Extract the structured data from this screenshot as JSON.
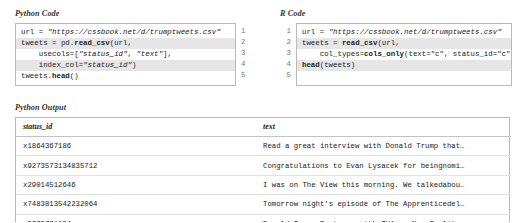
{
  "sections": {
    "python_code_label": "Python Code",
    "r_code_label": "R Code",
    "python_output_label": "Python Output"
  },
  "python_code": {
    "line_numbers": [
      "1",
      "2",
      "3",
      "4",
      "5"
    ],
    "lines": [
      [
        {
          "t": "url = ",
          "s": "plain"
        },
        {
          "t": "\"https://cssbook.net/d/trumptweets.csv\"",
          "s": "str"
        }
      ],
      [
        {
          "t": "tweets = pd.",
          "s": "plain"
        },
        {
          "t": "read_csv",
          "s": "kw"
        },
        {
          "t": "(url,",
          "s": "plain"
        }
      ],
      [
        {
          "t": "    usecols=[",
          "s": "plain"
        },
        {
          "t": "\"status_id\"",
          "s": "str"
        },
        {
          "t": ", ",
          "s": "plain"
        },
        {
          "t": "\"text\"",
          "s": "str"
        },
        {
          "t": "],",
          "s": "plain"
        }
      ],
      [
        {
          "t": "    index_col=",
          "s": "plain"
        },
        {
          "t": "\"status_id\"",
          "s": "str"
        },
        {
          "t": ")",
          "s": "plain"
        }
      ],
      [
        {
          "t": "tweets.",
          "s": "plain"
        },
        {
          "t": "head",
          "s": "kw"
        },
        {
          "t": "()",
          "s": "plain"
        }
      ]
    ]
  },
  "r_code": {
    "line_numbers": [
      "1",
      "2",
      "3",
      "4",
      "5"
    ],
    "lines": [
      [
        {
          "t": "url = ",
          "s": "plain"
        },
        {
          "t": "\"https://cssbook.net/d/trumptweets.csv\"",
          "s": "str"
        }
      ],
      [
        {
          "t": "tweets = ",
          "s": "plain"
        },
        {
          "t": "read_csv",
          "s": "kw"
        },
        {
          "t": "(url,",
          "s": "plain"
        }
      ],
      [
        {
          "t": "    col_types=",
          "s": "plain"
        },
        {
          "t": "cols_only",
          "s": "kw"
        },
        {
          "t": "(text=\"c\", status_id=\"c\"))",
          "s": "plain"
        }
      ],
      [
        {
          "t": "head",
          "s": "kw"
        },
        {
          "t": "(tweets)",
          "s": "plain"
        }
      ],
      []
    ]
  },
  "output_table": {
    "columns": [
      "status_id",
      "text"
    ],
    "rows": [
      {
        "status_id": "x1864367186",
        "text": "Read a great interview with Donald Trump that…"
      },
      {
        "status_id": "x9273573134835712",
        "text": "Congratulations to Evan Lysacek for beingnomi…"
      },
      {
        "status_id": "x29014512646",
        "text": "I was on The View this morning. We talkedabou…"
      },
      {
        "status_id": "x7483813542232064",
        "text": "Tomorrow night's episode of The Apprenticedel…"
      },
      {
        "status_id": "x5775731054",
        "text": "Donald Trump Partners with TV1 on New Reality…"
      }
    ]
  },
  "colors": {
    "border": "#b9b9b9",
    "stripe": "#e6e6e6",
    "text": "#1a1a1a"
  }
}
